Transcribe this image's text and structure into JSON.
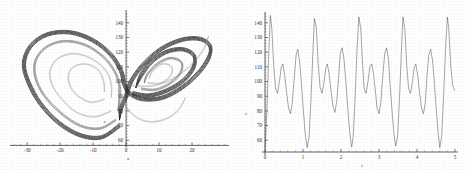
{
  "figure": {
    "title": "",
    "background_color": "#fefefe",
    "ink_color": "#3a3a3a"
  },
  "panels": [
    {
      "id": "phase-portrait",
      "position": "left",
      "axis_label_x": "x",
      "axis_label_y": "z"
    },
    {
      "id": "time-series",
      "position": "right",
      "axis_label_x": "t",
      "axis_label_y": "z"
    }
  ],
  "chart_data": [
    {
      "type": "line",
      "id": "phase-portrait",
      "title": "",
      "xlabel": "x",
      "ylabel": "z",
      "xlim": [
        -34,
        30
      ],
      "ylim": [
        52,
        146
      ],
      "xticks": [
        -30,
        -20,
        -10,
        0,
        10,
        20
      ],
      "yticks": [
        60,
        70,
        80,
        90,
        100,
        110,
        120,
        130,
        140
      ],
      "xtick_labels": [
        "-30",
        "-20",
        "-10",
        "0",
        "10",
        "20"
      ],
      "ytick_labels": [
        "60",
        "70",
        "80",
        "90",
        "100",
        "110",
        "120",
        "130",
        "140"
      ],
      "grid": false,
      "legend": "none",
      "description": "Lorenz-like strange attractor projected on the x-z plane; two-lobed butterfly with dense outer bands and nested inner spirals.",
      "series": [
        {
          "name": "attractor-outer-band",
          "weight": "dark",
          "points": [
            [
              -2.0,
              70.0
            ],
            [
              -7.5,
              62.0
            ],
            [
              -14.0,
              63.5
            ],
            [
              -20.5,
              72.0
            ],
            [
              -26.0,
              85.0
            ],
            [
              -29.5,
              99.0
            ],
            [
              -31.0,
              112.0
            ],
            [
              -29.0,
              124.0
            ],
            [
              -24.0,
              132.0
            ],
            [
              -17.0,
              133.5
            ],
            [
              -10.0,
              128.0
            ],
            [
              -4.5,
              118.0
            ],
            [
              -1.5,
              107.0
            ],
            [
              -0.5,
              98.0
            ],
            [
              1.0,
              92.0
            ],
            [
              5.0,
              88.0
            ],
            [
              11.0,
              89.0
            ],
            [
              17.0,
              96.0
            ],
            [
              22.0,
              106.0
            ],
            [
              25.0,
              116.0
            ],
            [
              25.5,
              124.0
            ],
            [
              22.5,
              129.0
            ],
            [
              17.0,
              128.5
            ],
            [
              10.5,
              122.0
            ],
            [
              5.0,
              111.0
            ],
            [
              1.5,
              100.0
            ],
            [
              0.0,
              90.0
            ],
            [
              -1.5,
              82.0
            ],
            [
              -2.0,
              74.0
            ]
          ]
        },
        {
          "name": "attractor-inner-left-1",
          "weight": "mid",
          "points": [
            [
              -3.0,
              74.0
            ],
            [
              -8.0,
              68.0
            ],
            [
              -14.0,
              70.0
            ],
            [
              -20.0,
              79.0
            ],
            [
              -25.0,
              91.0
            ],
            [
              -27.5,
              103.0
            ],
            [
              -27.5,
              114.0
            ],
            [
              -24.5,
              123.0
            ],
            [
              -19.0,
              127.5
            ],
            [
              -12.5,
              125.0
            ],
            [
              -7.0,
              117.0
            ],
            [
              -3.5,
              107.0
            ],
            [
              -2.0,
              97.0
            ],
            [
              -2.0,
              88.0
            ],
            [
              -2.5,
              80.0
            ]
          ]
        },
        {
          "name": "attractor-inner-left-2",
          "weight": "light",
          "points": [
            [
              -4.5,
              80.0
            ],
            [
              -9.5,
              76.0
            ],
            [
              -15.0,
              79.0
            ],
            [
              -19.5,
              88.0
            ],
            [
              -22.5,
              98.0
            ],
            [
              -23.0,
              108.0
            ],
            [
              -20.5,
              116.0
            ],
            [
              -15.5,
              119.0
            ],
            [
              -10.0,
              115.0
            ],
            [
              -6.0,
              107.0
            ],
            [
              -4.5,
              98.0
            ],
            [
              -4.5,
              89.0
            ]
          ]
        },
        {
          "name": "attractor-inner-left-3",
          "weight": "light",
          "points": [
            [
              -6.5,
              88.0
            ],
            [
              -11.0,
              86.0
            ],
            [
              -15.5,
              92.0
            ],
            [
              -17.5,
              101.0
            ],
            [
              -16.5,
              109.0
            ],
            [
              -12.5,
              112.0
            ],
            [
              -8.5,
              108.0
            ],
            [
              -6.8,
              100.0
            ],
            [
              -6.6,
              93.0
            ]
          ]
        },
        {
          "name": "attractor-inner-right-1",
          "weight": "dark",
          "points": [
            [
              2.0,
              92.0
            ],
            [
              7.0,
              90.5
            ],
            [
              12.5,
              94.0
            ],
            [
              17.5,
              101.0
            ],
            [
              20.5,
              110.0
            ],
            [
              20.5,
              118.0
            ],
            [
              17.0,
              122.0
            ],
            [
              12.0,
              120.0
            ],
            [
              7.5,
              113.0
            ],
            [
              4.5,
              104.0
            ],
            [
              3.0,
              96.0
            ]
          ]
        },
        {
          "name": "attractor-inner-right-2",
          "weight": "mid",
          "points": [
            [
              4.5,
              95.0
            ],
            [
              9.0,
              94.5
            ],
            [
              13.5,
              99.0
            ],
            [
              16.5,
              106.0
            ],
            [
              16.8,
              113.0
            ],
            [
              13.5,
              116.0
            ],
            [
              9.5,
              112.0
            ],
            [
              6.5,
              105.0
            ],
            [
              5.5,
              99.0
            ]
          ]
        },
        {
          "name": "attractor-inner-right-3",
          "weight": "light",
          "points": [
            [
              6.5,
              99.0
            ],
            [
              10.5,
              99.0
            ],
            [
              13.5,
              104.0
            ],
            [
              13.8,
              110.0
            ],
            [
              11.0,
              112.0
            ],
            [
              8.0,
              107.0
            ],
            [
              7.0,
              102.0
            ]
          ]
        },
        {
          "name": "transit-band-1",
          "weight": "light",
          "points": [
            [
              -1.0,
              100.0
            ],
            [
              3.0,
              97.0
            ],
            [
              9.0,
              97.5
            ],
            [
              15.0,
              103.0
            ],
            [
              20.0,
              112.0
            ],
            [
              23.5,
              122.0
            ],
            [
              25.0,
              131.0
            ]
          ]
        },
        {
          "name": "transit-band-2",
          "weight": "light",
          "points": [
            [
              -2.5,
              95.0
            ],
            [
              -1.0,
              87.0
            ],
            [
              1.0,
              80.0
            ],
            [
              4.0,
              74.5
            ],
            [
              8.0,
              72.5
            ],
            [
              12.5,
              75.0
            ],
            [
              16.0,
              81.0
            ],
            [
              18.0,
              89.0
            ]
          ]
        }
      ]
    },
    {
      "type": "line",
      "id": "time-series",
      "title": "",
      "xlabel": "t",
      "ylabel": "z",
      "xlim": [
        0,
        5
      ],
      "ylim": [
        52,
        146
      ],
      "xticks": [
        0,
        1,
        2,
        3,
        4,
        5
      ],
      "yticks": [
        60,
        70,
        80,
        90,
        100,
        110,
        120,
        130,
        140
      ],
      "xtick_labels": [
        "0",
        "1",
        "2",
        "3",
        "4",
        "5"
      ],
      "ytick_labels": [
        "60",
        "70",
        "80",
        "90",
        "100",
        "110",
        "120",
        "130",
        "140"
      ],
      "grid": false,
      "legend": "none",
      "description": "z-component time series of the attractor: irregular relaxation oscillation with tall narrow spikes reaching about 145 and deep minima near 53.",
      "series": [
        {
          "name": "z-of-t",
          "weight": "normal",
          "points": [
            [
              0.0,
              55.0
            ],
            [
              0.05,
              80.0
            ],
            [
              0.1,
              120.0
            ],
            [
              0.14,
              145.0
            ],
            [
              0.18,
              136.0
            ],
            [
              0.23,
              110.0
            ],
            [
              0.28,
              95.0
            ],
            [
              0.33,
              92.0
            ],
            [
              0.38,
              100.0
            ],
            [
              0.43,
              110.0
            ],
            [
              0.47,
              112.0
            ],
            [
              0.52,
              104.0
            ],
            [
              0.57,
              92.0
            ],
            [
              0.62,
              82.0
            ],
            [
              0.67,
              78.0
            ],
            [
              0.72,
              86.0
            ],
            [
              0.77,
              103.0
            ],
            [
              0.82,
              118.0
            ],
            [
              0.86,
              122.0
            ],
            [
              0.91,
              114.0
            ],
            [
              0.96,
              98.0
            ],
            [
              1.01,
              80.0
            ],
            [
              1.06,
              64.0
            ],
            [
              1.11,
              55.0
            ],
            [
              1.16,
              62.0
            ],
            [
              1.21,
              88.0
            ],
            [
              1.26,
              120.0
            ],
            [
              1.3,
              143.0
            ],
            [
              1.35,
              137.0
            ],
            [
              1.4,
              112.0
            ],
            [
              1.45,
              96.0
            ],
            [
              1.5,
              92.0
            ],
            [
              1.55,
              99.0
            ],
            [
              1.6,
              109.0
            ],
            [
              1.64,
              112.0
            ],
            [
              1.69,
              105.0
            ],
            [
              1.74,
              93.0
            ],
            [
              1.79,
              83.0
            ],
            [
              1.84,
              79.0
            ],
            [
              1.89,
              87.0
            ],
            [
              1.94,
              104.0
            ],
            [
              1.98,
              119.0
            ],
            [
              2.03,
              123.0
            ],
            [
              2.08,
              115.0
            ],
            [
              2.13,
              99.0
            ],
            [
              2.18,
              81.0
            ],
            [
              2.23,
              65.0
            ],
            [
              2.28,
              55.5
            ],
            [
              2.32,
              62.0
            ],
            [
              2.37,
              88.0
            ],
            [
              2.42,
              121.0
            ],
            [
              2.47,
              144.0
            ],
            [
              2.52,
              136.0
            ],
            [
              2.57,
              111.0
            ],
            [
              2.61,
              95.0
            ],
            [
              2.66,
              92.0
            ],
            [
              2.71,
              100.0
            ],
            [
              2.76,
              110.0
            ],
            [
              2.81,
              112.0
            ],
            [
              2.86,
              104.0
            ],
            [
              2.91,
              92.0
            ],
            [
              2.95,
              82.0
            ],
            [
              3.0,
              78.0
            ],
            [
              3.05,
              86.0
            ],
            [
              3.1,
              104.0
            ],
            [
              3.15,
              119.0
            ],
            [
              3.2,
              123.0
            ],
            [
              3.25,
              115.0
            ],
            [
              3.29,
              99.0
            ],
            [
              3.34,
              81.0
            ],
            [
              3.39,
              65.0
            ],
            [
              3.44,
              56.0
            ],
            [
              3.49,
              63.0
            ],
            [
              3.54,
              89.0
            ],
            [
              3.59,
              121.0
            ],
            [
              3.63,
              144.0
            ],
            [
              3.68,
              136.0
            ],
            [
              3.73,
              111.0
            ],
            [
              3.78,
              95.0
            ],
            [
              3.83,
              92.0
            ],
            [
              3.88,
              100.0
            ],
            [
              3.93,
              110.0
            ],
            [
              3.97,
              112.0
            ],
            [
              4.02,
              104.0
            ],
            [
              4.07,
              92.0
            ],
            [
              4.12,
              82.0
            ],
            [
              4.17,
              78.0
            ],
            [
              4.22,
              86.0
            ],
            [
              4.26,
              103.0
            ],
            [
              4.31,
              118.0
            ],
            [
              4.36,
              122.0
            ],
            [
              4.41,
              114.0
            ],
            [
              4.46,
              98.0
            ],
            [
              4.51,
              80.0
            ],
            [
              4.56,
              64.0
            ],
            [
              4.6,
              55.0
            ],
            [
              4.65,
              63.0
            ],
            [
              4.7,
              90.0
            ],
            [
              4.75,
              122.0
            ],
            [
              4.8,
              144.0
            ],
            [
              4.84,
              135.0
            ],
            [
              4.89,
              110.0
            ],
            [
              4.94,
              97.0
            ],
            [
              4.99,
              94.0
            ],
            [
              5.03,
              101.0
            ],
            [
              5.08,
              110.0
            ],
            [
              5.13,
              112.0
            ],
            [
              5.18,
              103.0
            ],
            [
              5.23,
              90.0
            ],
            [
              5.28,
              80.0
            ],
            [
              5.32,
              77.0
            ]
          ]
        }
      ]
    }
  ]
}
